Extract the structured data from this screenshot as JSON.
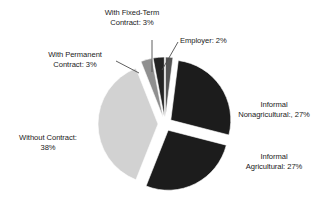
{
  "chart_data": {
    "type": "pie",
    "title": "",
    "subtitle": "",
    "xlabel": "",
    "ylabel": "",
    "legend_position": "none",
    "grid": false,
    "exploded": true,
    "units": "percent",
    "categories": [
      "Employer",
      "Informal Nonagricultural",
      "Informal Agricultural",
      "Without Contract",
      "With Permanent Contract",
      "With Fixed-Term Contract"
    ],
    "values": [
      2,
      27,
      27,
      38,
      3,
      3
    ],
    "slices": [
      {
        "name": "employer",
        "label_text": "Employer: 2%",
        "label_lines": [
          "Employer: 2%"
        ],
        "value": 2,
        "color": "#555555",
        "start_angle": 0,
        "sweep_angle": 7.2,
        "explode": 7
      },
      {
        "name": "informal-nonagricultural",
        "label_text": "Informal Nonagricultural:, 27%",
        "label_lines": [
          "Informal",
          "Nonagricultural:, 27%"
        ],
        "value": 27,
        "color": "#1c1c1c",
        "start_angle": 7.2,
        "sweep_angle": 97.2,
        "explode": 7
      },
      {
        "name": "informal-agricultural",
        "label_text": "Informal Agricultural: 27%",
        "label_lines": [
          "Informal",
          "Agricultural: 27%"
        ],
        "value": 27,
        "color": "#1c1c1c",
        "start_angle": 104.4,
        "sweep_angle": 97.2,
        "explode": 7
      },
      {
        "name": "without-contract",
        "label_text": "Without Contract: 38%",
        "label_lines": [
          "Without Contract:",
          "38%"
        ],
        "value": 38,
        "color": "#d2d2d2",
        "start_angle": 201.6,
        "sweep_angle": 136.8,
        "explode": 7
      },
      {
        "name": "with-permanent-contract",
        "label_text": "With Permanent Contract: 3%",
        "label_lines": [
          "With Permanent",
          "Contract: 3%"
        ],
        "value": 3,
        "color": "#8f8f8f",
        "start_angle": 338.4,
        "sweep_angle": 10.8,
        "explode": 7
      },
      {
        "name": "with-fixed-term-contract",
        "label_text": "With Fixed-Term Contract: 3%",
        "label_lines": [
          "With Fixed-Term",
          "Contract: 3%"
        ],
        "value": 3,
        "color": "#232323",
        "start_angle": 349.2,
        "sweep_angle": 10.8,
        "explode": 7
      }
    ],
    "colors": {
      "informal_dark": "#1c1c1c",
      "without_contract_light": "#d2d2d2",
      "permanent_medium": "#8f8f8f",
      "employer_gray": "#555555",
      "background": "#ffffff",
      "text": "#1a1a1a",
      "leader_line": "#4d4d4d"
    }
  },
  "labels": {
    "fixed_term": {
      "line1": "With Fixed-Term",
      "line2": "Contract: 3%"
    },
    "employer": {
      "line1": "Employer: 2%"
    },
    "permanent": {
      "line1": "With Permanent",
      "line2": "Contract: 3%"
    },
    "nonagricultural": {
      "line1": "Informal",
      "line2": "Nonagricultural:, 27%"
    },
    "agricultural": {
      "line1": "Informal",
      "line2": "Agricultural: 27%"
    },
    "without_contract": {
      "line1": "Without Contract:",
      "line2": "38%"
    }
  }
}
